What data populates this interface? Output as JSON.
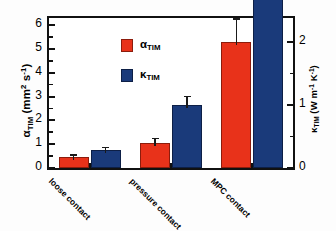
{
  "chart_data": {
    "type": "bar",
    "title": "",
    "subtitle": "",
    "categories": [
      "loose contact",
      "pressure contact",
      "MPC contact"
    ],
    "series": [
      {
        "name": "alpha_TIM",
        "legend_label": "α",
        "legend_sub": "TIM",
        "color": "#e8321a",
        "axis": "left",
        "values": [
          0.45,
          1.05,
          5.3
        ],
        "errors": [
          0.13,
          0.22,
          1.0
        ]
      },
      {
        "name": "kappa_TIM",
        "legend_label": "κ",
        "legend_sub": "TIM",
        "color": "#1a3a7a",
        "axis": "right",
        "values": [
          0.28,
          1.0,
          4.25
        ],
        "errors": [
          0.06,
          0.15,
          1.05
        ]
      }
    ],
    "xlabel": "",
    "ylabel": "α",
    "ylabel_sub": "TIM",
    "ylabel_unit": "(mm",
    "ylabel_unit_sup": "2",
    "ylabel_unit_2": " s",
    "ylabel_unit_sup2": "-1",
    "ylabel_unit_close": ")",
    "y2label": "κ",
    "y2label_sub": "TIM",
    "y2label_unit": "(W m",
    "y2label_unit_sup": "-1",
    "y2label_unit_2": " K",
    "y2label_unit_sup2": "-1",
    "y2label_unit_close": ")",
    "ylim": [
      0,
      6.3
    ],
    "y2lim": [
      0,
      2.3846
    ],
    "yticks": [
      0,
      1,
      2,
      3,
      4,
      5,
      6
    ],
    "yticks_minor": [
      0.5,
      1.5,
      2.5,
      3.5,
      4.5,
      5.5
    ],
    "y2ticks": [
      0,
      1,
      2
    ],
    "y2ticks_minor": [
      0.5,
      1.5
    ],
    "grid": false,
    "legend_position": "upper-left-inside",
    "tick_labels_y": [
      "0",
      "1",
      "2",
      "3",
      "4",
      "5",
      "6"
    ],
    "tick_labels_y2": [
      "0",
      "1",
      "2"
    ]
  },
  "axes": {
    "left_title_parts": {
      "symbol": "α",
      "subscript": "TIM",
      "unit_open": " (mm",
      "unit_sup1": "2",
      "unit_mid": " s",
      "unit_sup2": "-1",
      "unit_close": ")"
    },
    "right_title_parts": {
      "symbol": "κ",
      "subscript": "TIM",
      "unit_open": " (W m",
      "unit_sup1": "-1",
      "unit_mid": " K",
      "unit_sup2": "-1",
      "unit_close": ")"
    }
  },
  "legend": {
    "items": [
      {
        "symbol": "α",
        "subscript": "TIM",
        "color": "#e8321a"
      },
      {
        "symbol": "κ",
        "subscript": "TIM",
        "color": "#1a3a7a"
      }
    ]
  }
}
